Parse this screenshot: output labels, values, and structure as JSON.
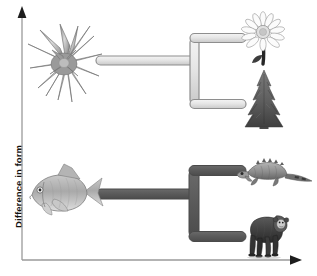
{
  "figure": {
    "background_color": "#ffffff"
  },
  "axes": {
    "y_axis": {
      "label": "Difference in form",
      "orientation": "vertical",
      "arrow": "up-arrow-icon",
      "color": "#8a8a8a",
      "tick_labels": []
    },
    "x_axis": {
      "label": "",
      "orientation": "horizontal",
      "arrow": "right-arrow-icon",
      "color": "#8a8a8a",
      "tick_labels": []
    }
  },
  "colors": {
    "branch_light_fill": "#e4e4e4",
    "branch_light_stroke": "#8e8e8e",
    "branch_dark_fill": "#5c5c5c",
    "branch_dark_stroke": "#4a4a4a",
    "axis": "#8a8a8a",
    "text": "#111111"
  },
  "clades": [
    {
      "id": "plant-clade",
      "name": "plant lineage",
      "branch_style": "light",
      "ancestor": {
        "icon": "rosette-plant-icon",
        "label": "ancestral plant"
      },
      "descendants": [
        {
          "icon": "daisy-flower-icon",
          "label": "flowering plant"
        },
        {
          "icon": "conifer-tree-icon",
          "label": "conifer tree"
        }
      ]
    },
    {
      "id": "vertebrate-clade",
      "name": "vertebrate lineage",
      "branch_style": "dark",
      "ancestor": {
        "icon": "fish-icon",
        "label": "ancestral fish"
      },
      "descendants": [
        {
          "icon": "iguana-lizard-icon",
          "label": "lizard"
        },
        {
          "icon": "chimpanzee-icon",
          "label": "chimpanzee"
        }
      ]
    }
  ]
}
